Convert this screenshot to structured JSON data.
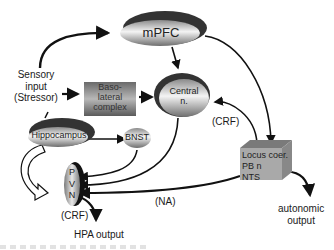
{
  "diagram": {
    "nodes": {
      "mpfc": {
        "label": "mPFC"
      },
      "basolateral": {
        "label_lines": [
          "Baso-",
          "lateral",
          "complex"
        ]
      },
      "central": {
        "label_lines": [
          "Central",
          "n."
        ]
      },
      "hippocampus": {
        "label": "Hippocampus"
      },
      "bnst": {
        "label": "BNST"
      },
      "pvn": {
        "label_lines": [
          "P",
          "V",
          "N"
        ]
      },
      "locus": {
        "label_lines": [
          "Locus coer.",
          "PB n",
          "NTS"
        ]
      }
    },
    "labels": {
      "sensory_input": [
        "Sensory",
        "input",
        "(Stressor)"
      ],
      "crf_central": "(CRF)",
      "crf_pvn": "(CRF)",
      "na": "(NA)",
      "hpa_output": "HPA output",
      "autonomic_output": [
        "autonomic",
        "output"
      ]
    },
    "colors": {
      "node_dark": "#3a3a3a",
      "node_light": "#f2f2f2",
      "box_gray": "#9a9a9a",
      "line": "#111111"
    }
  }
}
